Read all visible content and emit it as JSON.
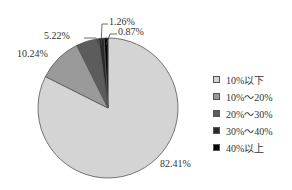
{
  "chart_data": {
    "type": "pie",
    "title": "",
    "start_angle": "12 o'clock",
    "direction": "clockwise from top for largest slice; small slices counterclockwise from top",
    "categories": [
      "10%以下",
      "10%～20%",
      "20%～30%",
      "30%～40%",
      "40%以上"
    ],
    "values": [
      82.41,
      10.24,
      5.22,
      1.26,
      0.87
    ],
    "labels": [
      "82.41%",
      "10.24%",
      "5.22%",
      "1.26%",
      "0.87%"
    ],
    "colors": [
      "#d4d4d4",
      "#9a9a9a",
      "#5c5c5c",
      "#2a2a2a",
      "#050505"
    ],
    "legend_position": "right"
  },
  "legend": {
    "items": [
      {
        "label": "10%以下",
        "color": "#d4d4d4"
      },
      {
        "label": "10%～20%",
        "color": "#9a9a9a"
      },
      {
        "label": "20%～30%",
        "color": "#5c5c5c"
      },
      {
        "label": "30%～40%",
        "color": "#2a2a2a"
      },
      {
        "label": "40%以上",
        "color": "#050505"
      }
    ]
  },
  "slice_labels": {
    "s0": "82.41%",
    "s1": "10.24%",
    "s2": "5.22%",
    "s3": "1.26%",
    "s4": "0.87%"
  }
}
